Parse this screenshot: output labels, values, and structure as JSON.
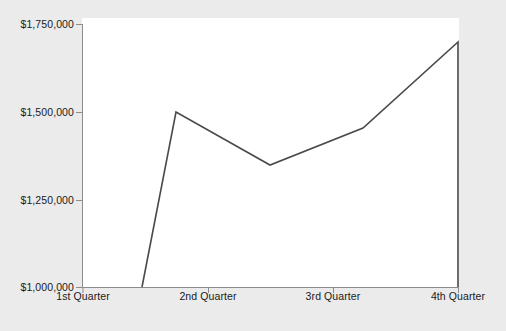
{
  "chart_data": {
    "type": "line",
    "title": "",
    "xlabel": "",
    "ylabel": "",
    "categories": [
      "1st Quarter",
      "2nd Quarter",
      "3rd Quarter",
      "4th Quarter"
    ],
    "x": [
      "1st Quarter",
      "2nd Quarter",
      "3rd Quarter",
      "4th Quarter"
    ],
    "values": [
      1000000,
      1500000,
      1355000,
      1695000
    ],
    "series": [
      {
        "name": "Sales",
        "values": [
          1000000,
          1500000,
          1355000,
          1695000
        ],
        "color": "#4a4a4a"
      }
    ],
    "ylim": [
      1000000,
      1750000
    ],
    "ytick_values": [
      1000000,
      1250000,
      1500000,
      1750000
    ],
    "ytick_labels": [
      "$1,000,000",
      "$1,250,000",
      "$1,500,000",
      "$1,750,000"
    ],
    "xtick_labels": [
      "1st Quarter",
      "2nd Quarter",
      "3rd Quarter",
      "4th Quarter"
    ],
    "grid": false,
    "legend": false,
    "legend_position": "none",
    "line_color": "#4a4a4a",
    "axis_color": "#808080",
    "plot_background": "#ffffff",
    "figure_background": "#ebebeb",
    "annotations": [],
    "vertices_px": [
      {
        "x": 142,
        "y": 287,
        "value": 1000000
      },
      {
        "x": 176,
        "y": 112,
        "value": 1500000
      },
      {
        "x": 270,
        "y": 165,
        "value": 1355000
      },
      {
        "x": 363,
        "y": 128,
        "value": 1450000
      },
      {
        "x": 458,
        "y": 42,
        "value": 1695000
      },
      {
        "x": 458,
        "y": 287,
        "value": 1000000
      }
    ]
  },
  "axes": {
    "y_ticks": [
      {
        "label": "$1,750,000",
        "top": 18
      },
      {
        "label": "$1,500,000",
        "top": 106
      },
      {
        "label": "$1,250,000",
        "top": 196
      },
      {
        "label": "$1,000,000",
        "top": 281
      }
    ],
    "x_ticks": [
      {
        "label": "1st Quarter",
        "left": 13
      },
      {
        "label": "2nd Quarter",
        "left": 138
      },
      {
        "label": "3rd Quarter",
        "left": 263
      },
      {
        "label": "4th Quarter",
        "left": 388
      }
    ]
  }
}
